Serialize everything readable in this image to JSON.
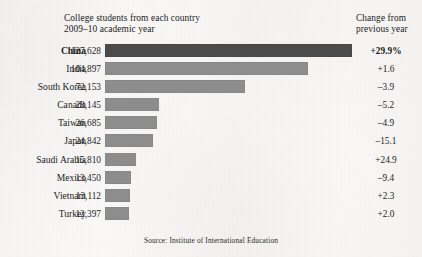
{
  "header": {
    "left_line1": "College students from each country",
    "left_line2": "2009–10 academic year",
    "right_line1": "Change from",
    "right_line2": "previous year"
  },
  "source": "Source: Institute of International Education",
  "colors": {
    "background": "#f7f6f4",
    "bar": "#8d8d8d",
    "bar_highlight": "#4b4b4b",
    "text": "#1c1c1c"
  },
  "chart_data": {
    "type": "bar",
    "orientation": "horizontal",
    "title": "College students from each country",
    "subtitle": "2009–10 academic year",
    "xlabel": "",
    "ylabel": "",
    "xlim": [
      0,
      127628
    ],
    "grid": false,
    "legend": false,
    "source": "Source: Institute of International Education",
    "categories": [
      "China",
      "India",
      "South Korea",
      "Canada",
      "Taiwan",
      "Japan",
      "Saudi Arabia",
      "Mexico",
      "Vietnam",
      "Turkey"
    ],
    "values": [
      127628,
      104897,
      72153,
      28145,
      26685,
      24842,
      15810,
      13450,
      13112,
      12397
    ],
    "value_labels": [
      "127,628",
      "104,897",
      "72,153",
      "28,145",
      "26,685",
      "24,842",
      "15,810",
      "13,450",
      "13,112",
      "12,397"
    ],
    "change_label_header": "Change from previous year",
    "change_values": [
      29.9,
      1.6,
      -3.9,
      -5.2,
      -4.9,
      -15.1,
      24.9,
      -9.4,
      2.3,
      2.0
    ],
    "change_labels": [
      "+29.9%",
      "+1.6",
      "–3.9",
      "–5.2",
      "–4.9",
      "–15.1",
      "+24.9",
      "–9.4",
      "+2.3",
      "+2.0"
    ],
    "highlight_index": 0,
    "rows": [
      {
        "country": "China",
        "value_label": "127,628",
        "value": 127628,
        "change_label": "+29.9%",
        "change": 29.9,
        "emphasis": true
      },
      {
        "country": "India",
        "value_label": "104,897",
        "value": 104897,
        "change_label": "+1.6",
        "change": 1.6,
        "emphasis": false
      },
      {
        "country": "South Korea",
        "value_label": "72,153",
        "value": 72153,
        "change_label": "–3.9",
        "change": -3.9,
        "emphasis": false
      },
      {
        "country": "Canada",
        "value_label": "28,145",
        "value": 28145,
        "change_label": "–5.2",
        "change": -5.2,
        "emphasis": false
      },
      {
        "country": "Taiwan",
        "value_label": "26,685",
        "value": 26685,
        "change_label": "–4.9",
        "change": -4.9,
        "emphasis": false
      },
      {
        "country": "Japan",
        "value_label": "24,842",
        "value": 24842,
        "change_label": "–15.1",
        "change": -15.1,
        "emphasis": false
      },
      {
        "country": "Saudi Arabia",
        "value_label": "15,810",
        "value": 15810,
        "change_label": "+24.9",
        "change": 24.9,
        "emphasis": false
      },
      {
        "country": "Mexico",
        "value_label": "13,450",
        "value": 13450,
        "change_label": "–9.4",
        "change": -9.4,
        "emphasis": false
      },
      {
        "country": "Vietnam",
        "value_label": "13,112",
        "value": 13112,
        "change_label": "+2.3",
        "change": 2.3,
        "emphasis": false
      },
      {
        "country": "Turkey",
        "value_label": "12,397",
        "value": 12397,
        "change_label": "+2.0",
        "change": 2.0,
        "emphasis": false
      }
    ]
  }
}
